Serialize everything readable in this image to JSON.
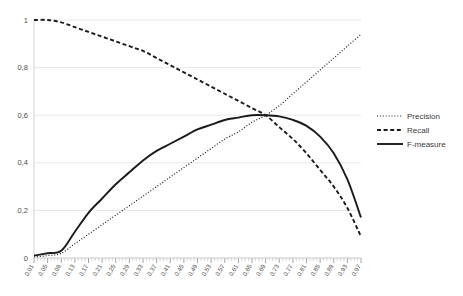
{
  "chart_data": {
    "type": "line",
    "title": "",
    "xlabel": "",
    "ylabel": "",
    "xlim": [
      0.01,
      0.97
    ],
    "ylim": [
      0,
      1
    ],
    "grid": true,
    "legend_position": "right",
    "ytick_labels": [
      "0",
      "0,2",
      "0,4",
      "0,6",
      "0,8",
      "1"
    ],
    "ytick_values": [
      0,
      0.2,
      0.4,
      0.6,
      0.8,
      1
    ],
    "categories": [
      "0,01",
      "0,05",
      "0,09",
      "0,13",
      "0,17",
      "0,21",
      "0,25",
      "0,29",
      "0,33",
      "0,37",
      "0,41",
      "0,45",
      "0,49",
      "0,53",
      "0,57",
      "0,61",
      "0,65",
      "0,69",
      "0,73",
      "0,77",
      "0,81",
      "0,85",
      "0,89",
      "0,93",
      "0,97"
    ],
    "x": [
      0.01,
      0.05,
      0.09,
      0.13,
      0.17,
      0.21,
      0.25,
      0.29,
      0.33,
      0.37,
      0.41,
      0.45,
      0.49,
      0.53,
      0.57,
      0.61,
      0.65,
      0.69,
      0.73,
      0.77,
      0.81,
      0.85,
      0.89,
      0.93,
      0.97
    ],
    "series": [
      {
        "name": "Precision",
        "style": "dotted",
        "values": [
          0.005,
          0.01,
          0.02,
          0.06,
          0.1,
          0.14,
          0.18,
          0.22,
          0.26,
          0.3,
          0.34,
          0.38,
          0.42,
          0.46,
          0.5,
          0.53,
          0.57,
          0.6,
          0.64,
          0.69,
          0.74,
          0.79,
          0.84,
          0.89,
          0.94
        ]
      },
      {
        "name": "Recall",
        "style": "dashed",
        "values": [
          1.0,
          1.0,
          0.99,
          0.97,
          0.95,
          0.93,
          0.91,
          0.89,
          0.87,
          0.84,
          0.81,
          0.78,
          0.75,
          0.72,
          0.69,
          0.66,
          0.63,
          0.6,
          0.55,
          0.5,
          0.44,
          0.37,
          0.3,
          0.21,
          0.09
        ]
      },
      {
        "name": "F-measure",
        "style": "solid",
        "values": [
          0.01,
          0.02,
          0.03,
          0.11,
          0.19,
          0.25,
          0.31,
          0.36,
          0.41,
          0.45,
          0.48,
          0.51,
          0.54,
          0.56,
          0.58,
          0.59,
          0.6,
          0.6,
          0.595,
          0.58,
          0.555,
          0.51,
          0.44,
          0.33,
          0.17
        ]
      }
    ]
  },
  "legend": {
    "items": [
      {
        "label": "Precision",
        "style": "dotted"
      },
      {
        "label": "Recall",
        "style": "dashed"
      },
      {
        "label": "F-measure",
        "style": "solid"
      }
    ]
  },
  "colors": {
    "series": "#1a1a1a",
    "grid": "#e8e8e8",
    "axis": "#d3d3d3",
    "text": "#4d4d4d",
    "background": "#ffffff"
  }
}
